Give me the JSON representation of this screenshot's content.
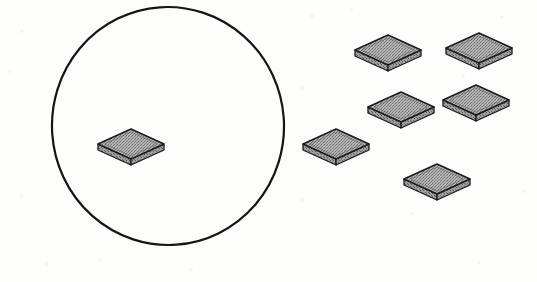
{
  "figure": {
    "background_color": "#fdfdfc",
    "canvas": {
      "width": 537,
      "height": 282
    },
    "ink_color": "#151515",
    "tile_top_color": "#9a9a9a",
    "tile_side_color": "#8a8a8a",
    "tile_edge_color": "#1a1a1a",
    "circle": {
      "label": "hand-drawn enclosing circle",
      "center_x": 168,
      "center_y": 126,
      "radius_x": 116,
      "radius_y": 119,
      "stroke_width": 2.2,
      "stroke_color": "#151515",
      "fill": "none"
    },
    "tiles": [
      {
        "name": "tile-inside-circle",
        "inside_circle": true,
        "center_x": 131,
        "center_y": 144,
        "half_width": 33,
        "half_height": 15,
        "thickness": 6
      },
      {
        "name": "tile-outside-top-left",
        "inside_circle": false,
        "center_x": 388,
        "center_y": 50,
        "half_width": 33,
        "half_height": 15,
        "thickness": 6
      },
      {
        "name": "tile-outside-top-right",
        "inside_circle": false,
        "center_x": 479,
        "center_y": 48,
        "half_width": 33,
        "half_height": 15,
        "thickness": 6
      },
      {
        "name": "tile-outside-middle-left",
        "inside_circle": false,
        "center_x": 401,
        "center_y": 107,
        "half_width": 33,
        "half_height": 15,
        "thickness": 6
      },
      {
        "name": "tile-outside-middle-right",
        "inside_circle": false,
        "center_x": 476,
        "center_y": 100,
        "half_width": 33,
        "half_height": 15,
        "thickness": 6
      },
      {
        "name": "tile-outside-lower-left",
        "inside_circle": false,
        "center_x": 336,
        "center_y": 144,
        "half_width": 33,
        "half_height": 15,
        "thickness": 6
      },
      {
        "name": "tile-outside-bottom",
        "inside_circle": false,
        "center_x": 437,
        "center_y": 179,
        "half_width": 33,
        "half_height": 15,
        "thickness": 6
      }
    ],
    "speckles": [
      {
        "x": 20,
        "y": 30,
        "size": 3
      },
      {
        "x": 310,
        "y": 14,
        "size": 4
      },
      {
        "x": 350,
        "y": 8,
        "size": 3
      },
      {
        "x": 500,
        "y": 15,
        "size": 3
      },
      {
        "x": 8,
        "y": 70,
        "size": 3
      },
      {
        "x": 300,
        "y": 86,
        "size": 4
      },
      {
        "x": 462,
        "y": 75,
        "size": 3
      },
      {
        "x": 20,
        "y": 195,
        "size": 3
      },
      {
        "x": 300,
        "y": 198,
        "size": 4
      },
      {
        "x": 410,
        "y": 212,
        "size": 3
      },
      {
        "x": 522,
        "y": 190,
        "size": 3
      },
      {
        "x": 45,
        "y": 262,
        "size": 4
      },
      {
        "x": 98,
        "y": 258,
        "size": 4
      },
      {
        "x": 190,
        "y": 268,
        "size": 3
      },
      {
        "x": 478,
        "y": 262,
        "size": 3
      }
    ]
  }
}
